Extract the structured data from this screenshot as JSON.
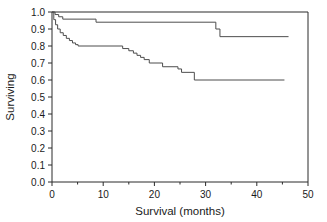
{
  "chart_data": {
    "type": "line",
    "title": "",
    "subtitle": "",
    "xlabel": "Survival (months)",
    "ylabel": "Surviving",
    "xlim": [
      0,
      50
    ],
    "ylim": [
      0.0,
      1.0
    ],
    "grid": false,
    "legend_position": "none",
    "xticks": [
      0,
      10,
      20,
      30,
      40,
      50
    ],
    "xtick_labels": [
      "0",
      "10",
      "20",
      "30",
      "40",
      "50"
    ],
    "xticks_minor": [
      5,
      15,
      25,
      35,
      45
    ],
    "yticks": [
      0.0,
      0.1,
      0.2,
      0.3,
      0.4,
      0.5,
      0.6,
      0.7,
      0.8,
      0.9,
      1.0
    ],
    "ytick_labels": [
      "0.0",
      "0.1",
      "0.2",
      "0.3",
      "0.4",
      "0.5",
      "0.6",
      "0.7",
      "0.8",
      "0.9",
      "1.0"
    ],
    "line_color": "#4d4d4d",
    "axis_color": "#2b2b2b",
    "background_color": "#ffffff",
    "series": [
      {
        "name": "upper-curve",
        "step": "post",
        "x": [
          0.0,
          0.6,
          0.6,
          1.3,
          1.3,
          2.1,
          2.1,
          8.6,
          8.6,
          32.0,
          32.0,
          32.8,
          32.8,
          46.2
        ],
        "y": [
          1.0,
          1.0,
          0.985,
          0.985,
          0.972,
          0.972,
          0.958,
          0.958,
          0.94,
          0.94,
          0.9,
          0.9,
          0.855,
          0.855
        ]
      },
      {
        "name": "lower-curve",
        "step": "post",
        "x": [
          0.0,
          0.35,
          0.35,
          0.7,
          0.7,
          1.1,
          1.1,
          1.6,
          1.6,
          2.2,
          2.2,
          2.8,
          2.8,
          3.4,
          3.4,
          4.0,
          4.0,
          4.6,
          4.6,
          5.1,
          5.1,
          13.8,
          13.8,
          15.0,
          15.0,
          15.9,
          15.9,
          16.6,
          16.6,
          17.3,
          17.3,
          18.0,
          18.0,
          19.0,
          19.0,
          21.6,
          21.6,
          24.6,
          24.6,
          25.3,
          25.3,
          27.8,
          27.8,
          45.4
        ],
        "y": [
          1.0,
          1.0,
          0.955,
          0.955,
          0.925,
          0.925,
          0.9,
          0.9,
          0.878,
          0.878,
          0.862,
          0.862,
          0.845,
          0.845,
          0.832,
          0.832,
          0.818,
          0.818,
          0.808,
          0.808,
          0.8,
          0.8,
          0.785,
          0.785,
          0.772,
          0.772,
          0.758,
          0.758,
          0.745,
          0.745,
          0.733,
          0.733,
          0.72,
          0.72,
          0.7,
          0.7,
          0.678,
          0.678,
          0.665,
          0.665,
          0.645,
          0.645,
          0.6,
          0.6
        ]
      }
    ]
  },
  "axes": {
    "xlabel": "Survival (months)",
    "ylabel": "Surviving"
  }
}
